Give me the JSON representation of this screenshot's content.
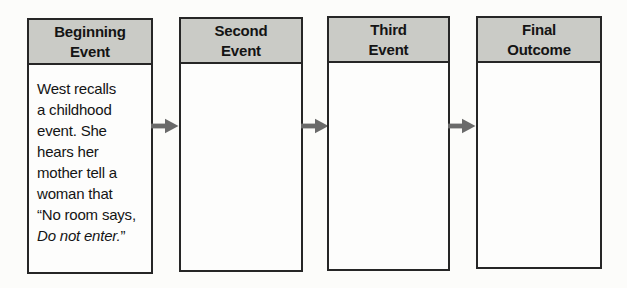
{
  "diagram": {
    "name": "sequence-of-events-graphic-organizer",
    "colors": {
      "header_bg": "#cacbc6",
      "box_bg": "#fdfdfc",
      "border": "#262626",
      "arrow": "#6a6a6a",
      "text": "#141414",
      "page_bg": "#fcfcfa"
    },
    "boxes": [
      {
        "id": "beginning-event",
        "title": "Beginning Event",
        "title_lines": [
          "Beginning",
          "Event"
        ],
        "body_lines": [
          [
            {
              "t": "West recalls"
            }
          ],
          [
            {
              "t": "a childhood"
            }
          ],
          [
            {
              "t": "event. She"
            }
          ],
          [
            {
              "t": "hears her"
            }
          ],
          [
            {
              "t": "mother tell a"
            }
          ],
          [
            {
              "t": "woman that"
            }
          ],
          [
            {
              "t": "“No room says,"
            }
          ],
          [
            {
              "t": "Do not enter.",
              "i": true
            },
            {
              "t": "”"
            }
          ]
        ]
      },
      {
        "id": "second-event",
        "title": "Second Event",
        "title_lines": [
          "Second",
          "Event"
        ],
        "body_lines": []
      },
      {
        "id": "third-event",
        "title": "Third Event",
        "title_lines": [
          "Third",
          "Event"
        ],
        "body_lines": []
      },
      {
        "id": "final-outcome",
        "title": "Final Outcome",
        "title_lines": [
          "Final",
          "Outcome"
        ],
        "body_lines": []
      }
    ],
    "arrows": [
      {
        "icon": "arrow-right-icon",
        "from": "beginning-event",
        "to": "second-event"
      },
      {
        "icon": "arrow-right-icon",
        "from": "second-event",
        "to": "third-event"
      },
      {
        "icon": "arrow-right-icon",
        "from": "third-event",
        "to": "final-outcome"
      }
    ]
  }
}
